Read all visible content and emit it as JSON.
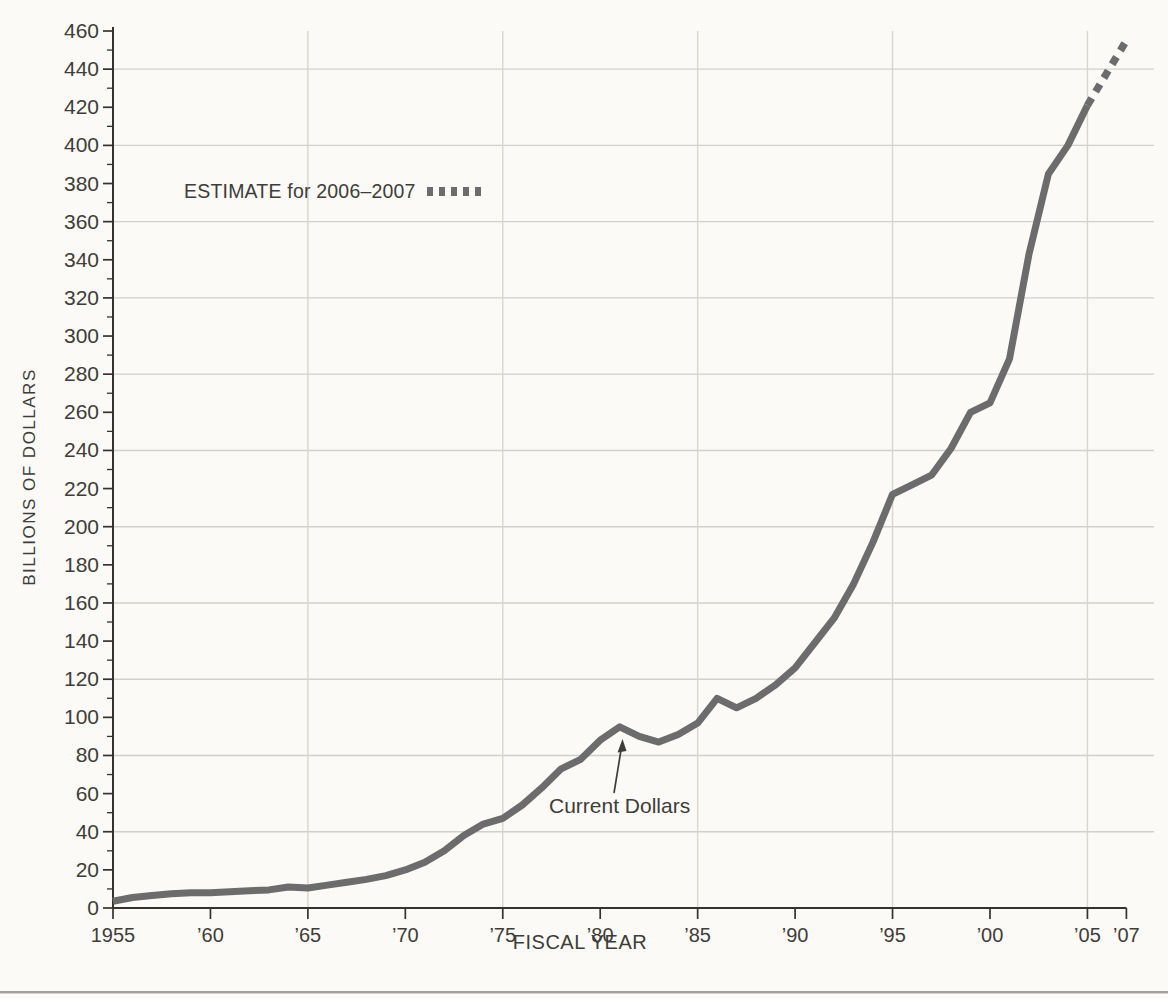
{
  "page": {
    "background": "#fbfaf6"
  },
  "chart_data": {
    "type": "line",
    "title": "",
    "xlabel": "FISCAL YEAR",
    "ylabel": "BILLIONS OF DOLLARS",
    "legend_label": "ESTIMATE for 2006–2007",
    "annotation": {
      "text": "Current Dollars",
      "target_year": 1981,
      "target_value": 95
    },
    "xlim": [
      1955,
      2007
    ],
    "ylim": [
      0,
      460
    ],
    "y_tick_step_major": 20,
    "y_tick_step_minor": 10,
    "x_tick_years": [
      1955,
      1960,
      1965,
      1970,
      1975,
      1980,
      1985,
      1990,
      1995,
      2000,
      2005,
      2007
    ],
    "x_tick_labels": [
      "1955",
      "’60",
      "’65",
      "’70",
      "’75",
      "’80",
      "’85",
      "’90",
      "’95",
      "’00",
      "’05",
      "’07"
    ],
    "grid": {
      "horizontal_step": 40,
      "vertical_years": [
        1965,
        1975,
        1985,
        1995,
        2005
      ]
    },
    "series": [
      {
        "name": "Current Dollars",
        "style": "solid",
        "points": [
          [
            1955,
            3.5
          ],
          [
            1956,
            5.5
          ],
          [
            1957,
            6.5
          ],
          [
            1958,
            7.5
          ],
          [
            1959,
            8
          ],
          [
            1960,
            8
          ],
          [
            1961,
            8.5
          ],
          [
            1962,
            9
          ],
          [
            1963,
            9.5
          ],
          [
            1964,
            11
          ],
          [
            1965,
            10.5
          ],
          [
            1966,
            12
          ],
          [
            1967,
            13.5
          ],
          [
            1968,
            15
          ],
          [
            1969,
            17
          ],
          [
            1970,
            20
          ],
          [
            1971,
            24
          ],
          [
            1972,
            30
          ],
          [
            1973,
            38
          ],
          [
            1974,
            44
          ],
          [
            1975,
            47
          ],
          [
            1976,
            54
          ],
          [
            1977,
            63
          ],
          [
            1978,
            73
          ],
          [
            1979,
            78
          ],
          [
            1980,
            88
          ],
          [
            1981,
            95
          ],
          [
            1982,
            90
          ],
          [
            1983,
            87
          ],
          [
            1984,
            91
          ],
          [
            1985,
            97
          ],
          [
            1986,
            110
          ],
          [
            1987,
            105
          ],
          [
            1988,
            110
          ],
          [
            1989,
            117
          ],
          [
            1990,
            126
          ],
          [
            1991,
            139
          ],
          [
            1992,
            152
          ],
          [
            1993,
            170
          ],
          [
            1994,
            192
          ],
          [
            1995,
            217
          ],
          [
            1996,
            222
          ],
          [
            1997,
            227
          ],
          [
            1998,
            241
          ],
          [
            1999,
            260
          ],
          [
            2000,
            265
          ],
          [
            2001,
            288
          ],
          [
            2002,
            343
          ],
          [
            2003,
            385
          ],
          [
            2004,
            400
          ],
          [
            2005,
            421
          ]
        ]
      },
      {
        "name": "ESTIMATE for 2006–2007",
        "style": "dashed",
        "points": [
          [
            2005,
            421
          ],
          [
            2006,
            438
          ],
          [
            2007,
            455
          ]
        ]
      }
    ],
    "colors": {
      "line": "#6c6c6c",
      "axis": "#35332f",
      "grid_h": "#d2d0cb",
      "grid_v": "#d8d6d1",
      "text": "#3f3d39"
    }
  }
}
